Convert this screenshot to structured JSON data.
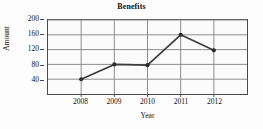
{
  "chart_data": {
    "type": "line",
    "title": "Benefits",
    "xlabel": "Year",
    "ylabel": "Amount",
    "categories": [
      "2008",
      "2009",
      "2010",
      "2011",
      "2012"
    ],
    "values": [
      40,
      80,
      78,
      160,
      118
    ],
    "series": [
      {
        "name": "Benefits",
        "values": [
          40,
          80,
          78,
          160,
          118
        ]
      }
    ],
    "x_tick_labels": [
      "2008",
      "2009",
      "2010",
      "2011",
      "2012"
    ],
    "y_tick_labels": [
      "200",
      "160",
      "120",
      "80",
      "40"
    ],
    "y_tick_values": [
      200,
      160,
      120,
      80,
      40
    ],
    "ylim": [
      0,
      200
    ],
    "xlim": [
      2007.6,
      2012.6
    ],
    "grid": true,
    "legend": null,
    "line_color": "#3c3c3c",
    "marker_color": "#2b2b2b",
    "grid_color": "#8c8c8c",
    "axis_color": "#4a4a4a",
    "background_color": "#fbfbfb"
  }
}
